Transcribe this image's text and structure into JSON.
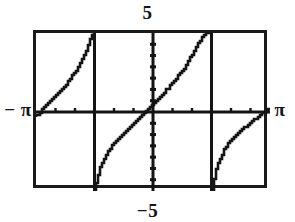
{
  "figure": {
    "kind": "graphing-calculator-screen",
    "background_color": "#ffffff",
    "ink_color": "#141414",
    "frame_color": "#1a1a1a"
  },
  "labels": {
    "y_max": "5",
    "y_min": "−5",
    "x_min": "− π",
    "x_max": "π"
  },
  "chart_data": {
    "type": "line",
    "title": "",
    "xlabel": "",
    "ylabel": "",
    "xlim": [
      -3.14159,
      3.14159
    ],
    "ylim": [
      -5,
      5
    ],
    "xtick_labels": [
      "− π",
      "π"
    ],
    "ytick_labels": [
      "5",
      "−5"
    ],
    "grid": false,
    "legend": false,
    "axes": {
      "x_axis_at_y": 0,
      "y_axis_at_x": 0,
      "x_tick_spacing": 0.5235988,
      "y_tick_spacing": 0.7142857,
      "tick_marks_visible": true
    },
    "asymptotes": [
      -1.5708,
      1.5708
    ],
    "zero_crossings": [
      -0.3
    ],
    "series": [
      {
        "name": "branch-left",
        "x": [
          -3.14159,
          -3.0,
          -2.85,
          -2.7,
          -2.55,
          -2.4,
          -2.25,
          -2.1,
          -1.95,
          -1.82,
          -1.72,
          -1.64,
          -1.6,
          -1.575
        ],
        "y": [
          -0.3,
          0.05,
          0.42,
          0.8,
          1.15,
          1.55,
          1.95,
          2.45,
          3.05,
          3.7,
          4.25,
          4.75,
          5.0,
          5.0
        ]
      },
      {
        "name": "branch-middle",
        "x": [
          -1.555,
          -1.52,
          -1.46,
          -1.38,
          -1.28,
          -1.15,
          -1.0,
          -0.85,
          -0.7,
          -0.55,
          -0.4,
          -0.3,
          -0.15,
          0.0,
          0.15,
          0.3,
          0.45,
          0.6,
          0.75,
          0.9,
          1.05,
          1.2,
          1.32,
          1.42,
          1.49,
          1.535,
          1.555
        ],
        "y": [
          -5.0,
          -4.6,
          -4.0,
          -3.4,
          -2.85,
          -2.35,
          -1.9,
          -1.5,
          -1.15,
          -0.8,
          -0.45,
          -0.22,
          0.1,
          0.45,
          0.8,
          1.2,
          1.6,
          2.0,
          2.45,
          2.95,
          3.55,
          4.2,
          4.7,
          5.0,
          5.0,
          5.0,
          5.0
        ]
      },
      {
        "name": "branch-right",
        "x": [
          1.62,
          1.66,
          1.72,
          1.8,
          1.92,
          2.05,
          2.2,
          2.35,
          2.5,
          2.65,
          2.8,
          2.95,
          3.05,
          3.14159
        ],
        "y": [
          -5.0,
          -4.3,
          -3.6,
          -3.0,
          -2.4,
          -1.95,
          -1.55,
          -1.2,
          -0.9,
          -0.62,
          -0.35,
          -0.1,
          0.08,
          0.25
        ]
      }
    ]
  }
}
